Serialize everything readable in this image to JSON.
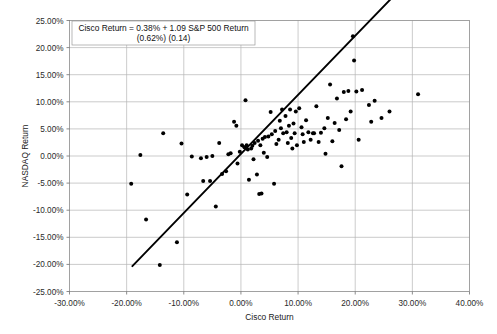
{
  "chart_data": {
    "type": "scatter",
    "title": "",
    "xlabel": "Cisco Return",
    "ylabel": "NASDAQ Return",
    "xlim": [
      -30,
      40
    ],
    "ylim": [
      -25,
      25
    ],
    "xticks": [
      "-30.00%",
      "-20.00%",
      "-10.00%",
      "0.00%",
      "10.00%",
      "20.00%",
      "30.00%",
      "40.00%"
    ],
    "xtick_values": [
      -30,
      -20,
      -10,
      0,
      10,
      20,
      30,
      40
    ],
    "yticks": [
      "25.00%",
      "20.00%",
      "15.00%",
      "10.00%",
      "5.00%",
      "0.00%",
      "-5.00%",
      "-10.00%",
      "-15.00%",
      "-20.00%",
      "-25.00%"
    ],
    "ytick_values": [
      25,
      20,
      15,
      10,
      5,
      0,
      -5,
      -10,
      -15,
      -20,
      -25
    ],
    "grid": true,
    "legend": "none",
    "marker_color": "#000000",
    "trendline_color": "#000000",
    "annotation_line1": "Cisco Return = 0.38% + 1.09 S&P 500 Return",
    "annotation_line2": "(0.62%)  (0.14)",
    "regression": {
      "intercept": 0.38,
      "slope": 1.09,
      "intercept_se": "(0.62%)",
      "slope_se": "(0.14)",
      "x_start": -19.0,
      "x_end": 29.5
    },
    "points": [
      [
        -19.2,
        -5.1
      ],
      [
        -17.6,
        0.2
      ],
      [
        -16.6,
        -11.7
      ],
      [
        -14.2,
        -20.1
      ],
      [
        -13.6,
        4.2
      ],
      [
        -11.2,
        -15.9
      ],
      [
        -10.4,
        2.3
      ],
      [
        -9.4,
        -7.1
      ],
      [
        -8.6,
        -0.1
      ],
      [
        -7.0,
        -0.4
      ],
      [
        -6.6,
        -4.6
      ],
      [
        -6.0,
        -0.2
      ],
      [
        -5.4,
        -4.6
      ],
      [
        -5.0,
        0.0
      ],
      [
        -4.4,
        -9.3
      ],
      [
        -3.8,
        2.4
      ],
      [
        -3.3,
        -3.3
      ],
      [
        -2.6,
        -2.8
      ],
      [
        -2.2,
        0.3
      ],
      [
        -1.8,
        0.5
      ],
      [
        -1.2,
        6.3
      ],
      [
        -0.8,
        5.6
      ],
      [
        -0.6,
        -1.4
      ],
      [
        -0.2,
        0.8
      ],
      [
        0.2,
        2.0
      ],
      [
        0.6,
        1.6
      ],
      [
        0.8,
        10.3
      ],
      [
        1.0,
        2.0
      ],
      [
        1.2,
        1.2
      ],
      [
        1.4,
        -4.4
      ],
      [
        1.8,
        1.4
      ],
      [
        2.0,
        1.9
      ],
      [
        2.2,
        -0.6
      ],
      [
        2.4,
        2.4
      ],
      [
        2.8,
        -3.4
      ],
      [
        3.0,
        2.8
      ],
      [
        3.2,
        -7.0
      ],
      [
        3.4,
        2.0
      ],
      [
        3.6,
        -6.9
      ],
      [
        3.8,
        3.2
      ],
      [
        4.0,
        0.6
      ],
      [
        4.2,
        3.5
      ],
      [
        4.6,
        -0.2
      ],
      [
        4.8,
        3.6
      ],
      [
        5.2,
        8.1
      ],
      [
        5.4,
        4.0
      ],
      [
        5.8,
        -5.1
      ],
      [
        6.0,
        4.6
      ],
      [
        6.2,
        2.2
      ],
      [
        6.6,
        3.0
      ],
      [
        6.8,
        6.5
      ],
      [
        7.0,
        5.1
      ],
      [
        7.2,
        8.6
      ],
      [
        7.4,
        4.2
      ],
      [
        7.8,
        7.4
      ],
      [
        8.0,
        4.4
      ],
      [
        8.2,
        2.4
      ],
      [
        8.4,
        5.6
      ],
      [
        8.6,
        8.6
      ],
      [
        8.8,
        3.3
      ],
      [
        9.0,
        1.4
      ],
      [
        9.2,
        6.0
      ],
      [
        9.4,
        4.2
      ],
      [
        9.6,
        8.2
      ],
      [
        9.8,
        2.0
      ],
      [
        10.2,
        8.8
      ],
      [
        10.6,
        5.3
      ],
      [
        10.8,
        4.0
      ],
      [
        11.0,
        2.6
      ],
      [
        11.4,
        6.6
      ],
      [
        11.8,
        4.4
      ],
      [
        12.2,
        3.0
      ],
      [
        12.6,
        4.2
      ],
      [
        12.8,
        4.2
      ],
      [
        13.2,
        9.2
      ],
      [
        13.6,
        2.6
      ],
      [
        14.0,
        4.3
      ],
      [
        14.6,
        5.1
      ],
      [
        14.8,
        0.4
      ],
      [
        15.2,
        7.0
      ],
      [
        15.6,
        13.2
      ],
      [
        16.0,
        2.7
      ],
      [
        16.4,
        6.1
      ],
      [
        16.8,
        10.6
      ],
      [
        17.2,
        4.8
      ],
      [
        17.6,
        -1.9
      ],
      [
        18.0,
        11.8
      ],
      [
        18.4,
        6.8
      ],
      [
        18.8,
        12.0
      ],
      [
        19.2,
        8.2
      ],
      [
        19.6,
        22.1
      ],
      [
        19.8,
        17.6
      ],
      [
        20.2,
        11.9
      ],
      [
        20.6,
        3.0
      ],
      [
        21.2,
        12.2
      ],
      [
        22.4,
        9.4
      ],
      [
        22.8,
        6.3
      ],
      [
        23.4,
        10.2
      ],
      [
        24.6,
        7.0
      ],
      [
        26.0,
        8.2
      ],
      [
        31.0,
        11.4
      ]
    ]
  }
}
